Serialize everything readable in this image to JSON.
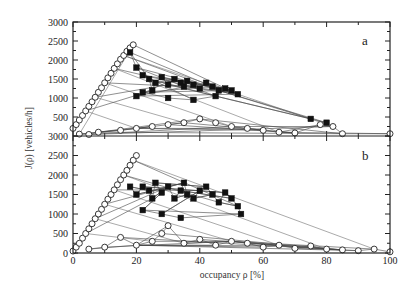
{
  "chart_data": [
    {
      "panel": "a",
      "type": "scatter",
      "title": "",
      "xlabel": "occupancy ρ [%]",
      "ylabel": "J(ρ) [vehicles/h]",
      "xlim": [
        0,
        100
      ],
      "ylim": [
        0,
        3000
      ],
      "x_ticks": [
        0,
        20,
        40,
        60,
        80,
        100
      ],
      "y_ticks": [
        0,
        500,
        1000,
        1500,
        2000,
        2500,
        3000
      ],
      "grid": false,
      "panel_label": "a",
      "series": [
        {
          "name": "free flow (open circles)",
          "marker": "circle-open",
          "points": [
            [
              0,
              200
            ],
            [
              1,
              300
            ],
            [
              2,
              420
            ],
            [
              3,
              540
            ],
            [
              4,
              660
            ],
            [
              5,
              780
            ],
            [
              6,
              900
            ],
            [
              7,
              1020
            ],
            [
              8,
              1150
            ],
            [
              9,
              1270
            ],
            [
              10,
              1400
            ],
            [
              11,
              1530
            ],
            [
              12,
              1650
            ],
            [
              13,
              1780
            ],
            [
              14,
              1900
            ],
            [
              15,
              2020
            ],
            [
              16,
              2120
            ],
            [
              17,
              2230
            ],
            [
              18,
              2320
            ],
            [
              19,
              2400
            ]
          ]
        },
        {
          "name": "synchronized / congested (filled squares)",
          "marker": "square-filled",
          "points": [
            [
              18,
              2200
            ],
            [
              20,
              1800
            ],
            [
              22,
              1600
            ],
            [
              24,
              1500
            ],
            [
              25,
              1200
            ],
            [
              26,
              1400
            ],
            [
              28,
              1550
            ],
            [
              30,
              1350
            ],
            [
              32,
              1500
            ],
            [
              34,
              1400
            ],
            [
              35,
              1300
            ],
            [
              36,
              1450
            ],
            [
              38,
              1350
            ],
            [
              40,
              1250
            ],
            [
              42,
              1400
            ],
            [
              44,
              1300
            ],
            [
              46,
              1200
            ],
            [
              48,
              1250
            ],
            [
              50,
              1200
            ],
            [
              52,
              1100
            ],
            [
              20,
              1050
            ],
            [
              22,
              1150
            ],
            [
              30,
              1000
            ],
            [
              38,
              950
            ],
            [
              45,
              1050
            ],
            [
              75,
              450
            ],
            [
              80,
              350
            ]
          ]
        },
        {
          "name": "low-flow / jammed (open circles)",
          "marker": "circle-open",
          "points": [
            [
              2,
              50
            ],
            [
              5,
              40
            ],
            [
              8,
              100
            ],
            [
              15,
              150
            ],
            [
              20,
              200
            ],
            [
              25,
              250
            ],
            [
              30,
              300
            ],
            [
              35,
              350
            ],
            [
              40,
              450
            ],
            [
              45,
              350
            ],
            [
              50,
              250
            ],
            [
              55,
              200
            ],
            [
              60,
              150
            ],
            [
              65,
              100
            ],
            [
              70,
              80
            ],
            [
              78,
              300
            ],
            [
              82,
              250
            ],
            [
              85,
              60
            ],
            [
              100,
              60
            ]
          ]
        }
      ]
    },
    {
      "panel": "b",
      "type": "scatter",
      "title": "",
      "xlabel": "occupancy ρ [%]",
      "ylabel": "J(ρ) [vehicles/h]",
      "xlim": [
        0,
        100
      ],
      "ylim": [
        0,
        3000
      ],
      "x_ticks": [
        0,
        20,
        40,
        60,
        80,
        100
      ],
      "y_ticks": [
        0,
        500,
        1000,
        1500,
        2000,
        2500,
        3000
      ],
      "grid": false,
      "panel_label": "b",
      "series": [
        {
          "name": "free flow (open circles)",
          "marker": "circle-open",
          "points": [
            [
              0,
              50
            ],
            [
              1,
              150
            ],
            [
              2,
              250
            ],
            [
              3,
              380
            ],
            [
              4,
              500
            ],
            [
              5,
              620
            ],
            [
              6,
              750
            ],
            [
              7,
              880
            ],
            [
              8,
              1000
            ],
            [
              9,
              1120
            ],
            [
              10,
              1250
            ],
            [
              11,
              1380
            ],
            [
              12,
              1500
            ],
            [
              13,
              1620
            ],
            [
              14,
              1750
            ],
            [
              15,
              1880
            ],
            [
              16,
              2000
            ],
            [
              17,
              2120
            ],
            [
              18,
              2250
            ],
            [
              19,
              2380
            ],
            [
              20,
              2500
            ]
          ]
        },
        {
          "name": "synchronized / congested (filled squares)",
          "marker": "square-filled",
          "points": [
            [
              18,
              1700
            ],
            [
              20,
              1500
            ],
            [
              22,
              1700
            ],
            [
              24,
              1600
            ],
            [
              25,
              1400
            ],
            [
              26,
              1800
            ],
            [
              28,
              1550
            ],
            [
              30,
              1700
            ],
            [
              32,
              1400
            ],
            [
              34,
              1600
            ],
            [
              35,
              1800
            ],
            [
              36,
              1500
            ],
            [
              38,
              1400
            ],
            [
              40,
              1600
            ],
            [
              42,
              1700
            ],
            [
              44,
              1500
            ],
            [
              46,
              1300
            ],
            [
              48,
              1550
            ],
            [
              50,
              1400
            ],
            [
              52,
              1200
            ],
            [
              53,
              1000
            ],
            [
              22,
              1100
            ],
            [
              28,
              1000
            ],
            [
              34,
              900
            ]
          ]
        },
        {
          "name": "low-flow / jammed (open circles)",
          "marker": "circle-open",
          "points": [
            [
              5,
              100
            ],
            [
              10,
              150
            ],
            [
              15,
              400
            ],
            [
              20,
              200
            ],
            [
              25,
              300
            ],
            [
              28,
              500
            ],
            [
              30,
              700
            ],
            [
              35,
              250
            ],
            [
              40,
              350
            ],
            [
              45,
              200
            ],
            [
              50,
              300
            ],
            [
              55,
              250
            ],
            [
              60,
              150
            ],
            [
              65,
              200
            ],
            [
              70,
              120
            ],
            [
              75,
              180
            ],
            [
              80,
              100
            ],
            [
              85,
              80
            ],
            [
              90,
              60
            ],
            [
              95,
              100
            ],
            [
              100,
              30
            ]
          ]
        }
      ]
    }
  ],
  "labels": {
    "xlabel": "occupancy ρ [%]",
    "ylabel": "J(ρ) [vehicles/h]",
    "panel_a": "a",
    "panel_b": "b"
  },
  "ticks": {
    "x": [
      "0",
      "20",
      "40",
      "60",
      "80",
      "100"
    ],
    "y_top": [
      "500",
      "1000",
      "1500",
      "2000",
      "2500",
      "3000"
    ],
    "y_bottom": [
      "0",
      "500",
      "1000",
      "1500",
      "2000",
      "2500",
      "3000"
    ]
  }
}
